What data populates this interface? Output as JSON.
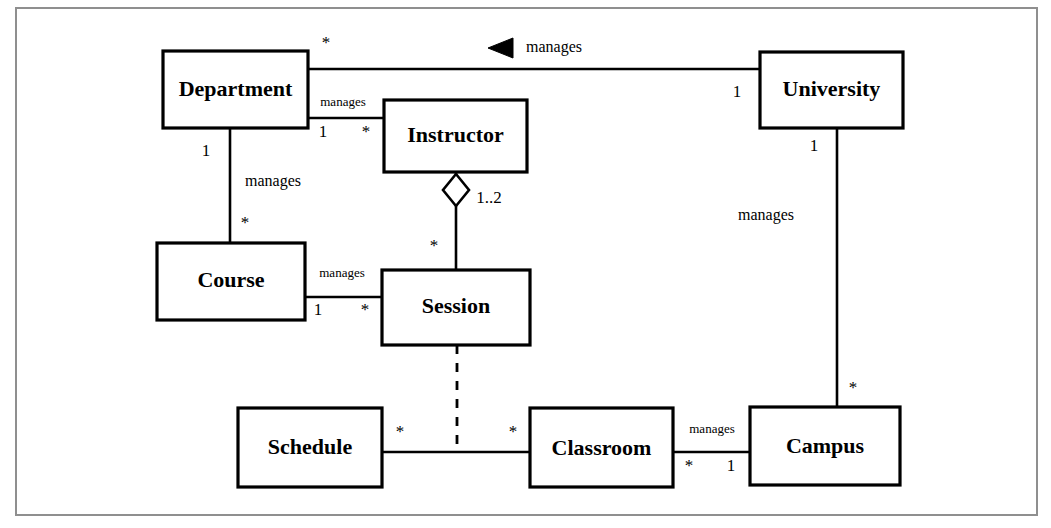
{
  "diagram": {
    "type": "uml-class-diagram",
    "frame": {
      "stroke_color": "#8f8f8f"
    },
    "classes": [
      {
        "id": "department",
        "name": "Department",
        "x": 163,
        "y": 51,
        "w": 145,
        "h": 77
      },
      {
        "id": "instructor",
        "name": "Instructor",
        "x": 384,
        "y": 100,
        "w": 143,
        "h": 72
      },
      {
        "id": "university",
        "name": "University",
        "x": 760,
        "y": 52,
        "w": 143,
        "h": 76
      },
      {
        "id": "course",
        "name": "Course",
        "x": 157,
        "y": 243,
        "w": 148,
        "h": 77
      },
      {
        "id": "session",
        "name": "Session",
        "x": 382,
        "y": 270,
        "w": 148,
        "h": 75
      },
      {
        "id": "schedule",
        "name": "Schedule",
        "x": 238,
        "y": 408,
        "w": 144,
        "h": 79
      },
      {
        "id": "classroom",
        "name": "Classroom",
        "x": 530,
        "y": 408,
        "w": 143,
        "h": 79
      },
      {
        "id": "campus",
        "name": "Campus",
        "x": 750,
        "y": 407,
        "w": 150,
        "h": 78
      }
    ],
    "associations": [
      {
        "id": "department-university",
        "from": "Department",
        "to": "University",
        "label": "manages",
        "from_multiplicity": "*",
        "to_multiplicity": "1",
        "navigation": "toward-department",
        "style": "solid"
      },
      {
        "id": "department-instructor",
        "from": "Department",
        "to": "Instructor",
        "label": "manages",
        "from_multiplicity": "1",
        "to_multiplicity": "*",
        "style": "solid"
      },
      {
        "id": "department-course",
        "from": "Department",
        "to": "Course",
        "label": "manages",
        "from_multiplicity": "1",
        "to_multiplicity": "*",
        "style": "solid"
      },
      {
        "id": "instructor-session",
        "from": "Instructor",
        "to": "Session",
        "label": "",
        "from_multiplicity": "1..2",
        "to_multiplicity": "*",
        "style": "aggregation"
      },
      {
        "id": "course-session",
        "from": "Course",
        "to": "Session",
        "label": "manages",
        "from_multiplicity": "1",
        "to_multiplicity": "*",
        "style": "solid"
      },
      {
        "id": "university-campus",
        "from": "University",
        "to": "Campus",
        "label": "manages",
        "from_multiplicity": "1",
        "to_multiplicity": "*",
        "style": "solid"
      },
      {
        "id": "schedule-classroom",
        "from": "Schedule",
        "to": "Classroom",
        "label": "",
        "from_multiplicity": "*",
        "to_multiplicity": "*",
        "style": "solid"
      },
      {
        "id": "classroom-campus",
        "from": "Classroom",
        "to": "Campus",
        "label": "manages",
        "from_multiplicity": "*",
        "to_multiplicity": "1",
        "style": "solid"
      },
      {
        "id": "session-schedule-classroom",
        "from": "Session",
        "to": "Schedule-Classroom link",
        "label": "",
        "from_multiplicity": "",
        "to_multiplicity": "",
        "style": "dashed"
      }
    ],
    "labels": {
      "manages": "manages",
      "star": "*",
      "one": "1",
      "one_to_two": "1..2"
    }
  }
}
